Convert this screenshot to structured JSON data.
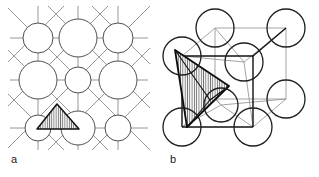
{
  "figure": {
    "background_color": "#ffffff",
    "width": 319,
    "height": 177
  },
  "panels": [
    {
      "id": "a",
      "label": "a",
      "caption": "two-dimensional projection of the close-packed lattice with shaded tetrahedral site",
      "label_position": {
        "x": 11,
        "y": 160
      },
      "view": "2d-projection",
      "colors": {
        "circle_stroke": "#4d4d4d",
        "bond_stroke": "#8c8c8c",
        "triangle_stroke": "#111111",
        "triangle_hatch": "#7a7a7a",
        "triangle_fill": "#e8e8e8"
      },
      "circle_stroke_width": 1.0,
      "bond_stroke_width": 0.9,
      "atoms": [
        {
          "name": "corner-top-left",
          "cx": 38,
          "cy": 38,
          "r": 15,
          "size": "large"
        },
        {
          "name": "edge-top-centre",
          "cx": 78,
          "cy": 38,
          "r": 19,
          "size": "x-large"
        },
        {
          "name": "corner-top-right",
          "cx": 118,
          "cy": 38,
          "r": 15,
          "size": "large"
        },
        {
          "name": "edge-middle-left",
          "cx": 38,
          "cy": 80,
          "r": 19,
          "size": "x-large"
        },
        {
          "name": "centre",
          "cx": 78,
          "cy": 80,
          "r": 13,
          "size": "medium"
        },
        {
          "name": "edge-middle-right",
          "cx": 118,
          "cy": 80,
          "r": 19,
          "size": "x-large"
        },
        {
          "name": "corner-bottom-left",
          "cx": 38,
          "cy": 128,
          "r": 13,
          "size": "medium"
        },
        {
          "name": "edge-bottom-centre",
          "cx": 78,
          "cy": 128,
          "r": 17,
          "size": "large"
        },
        {
          "name": "corner-bottom-right",
          "cx": 118,
          "cy": 128,
          "r": 13,
          "size": "medium"
        }
      ],
      "grid": {
        "vertical_lines_x": [
          38,
          78,
          118
        ],
        "horizontal_lines_y": [
          38,
          80,
          128
        ],
        "diagonals": true,
        "extent": {
          "x0": 10,
          "y0": 8,
          "x1": 148,
          "y1": 148
        }
      },
      "triangle": {
        "name": "tetrahedral-site-triangle",
        "points": [
          {
            "x": 57,
            "y": 104
          },
          {
            "x": 37,
            "y": 129
          },
          {
            "x": 79,
            "y": 129
          }
        ],
        "hatched": true,
        "hatch_angle_deg": 90,
        "hatch_spacing": 2.2
      }
    },
    {
      "id": "b",
      "label": "b",
      "caption": "face-centred cubic unit cell with hatched tetrahedron marking the interstitial site",
      "label_position": {
        "x": 170,
        "y": 160
      },
      "view": "3d-cube",
      "colors": {
        "circle_stroke": "#1f1f1f",
        "front_edge_stroke": "#111111",
        "back_edge_stroke": "#9a9a9a",
        "tetra_stroke": "#0d0d0d",
        "tetra_hatch": "#6f6f6f",
        "tetra_fill": "#f2f2f2"
      },
      "circle_stroke_width": 1.3,
      "front_edge_stroke_width": 1.4,
      "back_edge_stroke_width": 0.9,
      "cube_vertices": {
        "front_top_left": {
          "x": 182,
          "y": 56
        },
        "front_top_right": {
          "x": 253,
          "y": 56
        },
        "front_bottom_left": {
          "x": 182,
          "y": 127
        },
        "front_bottom_right": {
          "x": 253,
          "y": 127
        },
        "back_top_left": {
          "x": 215,
          "y": 28
        },
        "back_top_right": {
          "x": 286,
          "y": 28
        },
        "back_bottom_left": {
          "x": 215,
          "y": 99
        },
        "back_bottom_right": {
          "x": 286,
          "y": 99
        }
      },
      "atoms": [
        {
          "name": "corner-back-top-left",
          "cx": 215,
          "cy": 28,
          "r": 19,
          "depth": "back"
        },
        {
          "name": "corner-back-top-right",
          "cx": 286,
          "cy": 28,
          "r": 19,
          "depth": "back"
        },
        {
          "name": "corner-front-top-left",
          "cx": 182,
          "cy": 56,
          "r": 19,
          "depth": "front"
        },
        {
          "name": "face-centre-top",
          "cx": 244,
          "cy": 62,
          "r": 19,
          "depth": "mid"
        },
        {
          "name": "corner-back-bottom-right",
          "cx": 286,
          "cy": 99,
          "r": 19,
          "depth": "back"
        },
        {
          "name": "corner-front-bottom-left",
          "cx": 182,
          "cy": 127,
          "r": 19,
          "depth": "front"
        },
        {
          "name": "face-centre-front",
          "cx": 221,
          "cy": 105,
          "r": 17,
          "depth": "mid"
        },
        {
          "name": "corner-back-bottom-left",
          "cx": 215,
          "cy": 99,
          "r": 0,
          "depth": "back"
        },
        {
          "name": "corner-front-bottom-right",
          "cx": 253,
          "cy": 127,
          "r": 19,
          "depth": "front"
        }
      ],
      "tetrahedron": {
        "name": "interstitial-tetrahedron",
        "apex": {
          "x": 228,
          "y": 87
        },
        "points": [
          {
            "x": 175,
            "y": 50
          },
          {
            "x": 229,
            "y": 86
          },
          {
            "x": 187,
            "y": 127
          }
        ],
        "interior_vertex": {
          "x": 210,
          "y": 100
        },
        "hatched": true,
        "hatch_angle_deg": 90,
        "hatch_spacing": 2.2
      }
    }
  ]
}
